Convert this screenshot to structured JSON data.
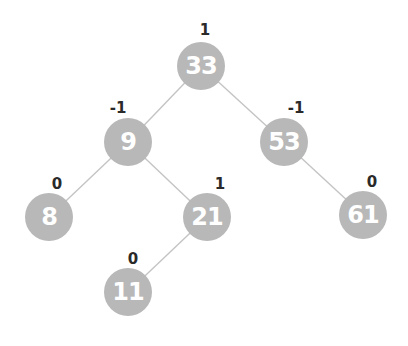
{
  "diagram": {
    "type": "AVL tree with balance factors",
    "nodes": [
      {
        "id": "n33",
        "value": "33",
        "balance": "1",
        "x": 201,
        "y": 66,
        "bx": 205,
        "by": 30
      },
      {
        "id": "n9",
        "value": "9",
        "balance": "-1",
        "x": 128,
        "y": 142,
        "bx": 118,
        "by": 108
      },
      {
        "id": "n53",
        "value": "53",
        "balance": "-1",
        "x": 284,
        "y": 142,
        "bx": 296,
        "by": 108
      },
      {
        "id": "n8",
        "value": "8",
        "balance": "0",
        "x": 49,
        "y": 217,
        "bx": 57,
        "by": 184
      },
      {
        "id": "n21",
        "value": "21",
        "balance": "1",
        "x": 207,
        "y": 217,
        "bx": 220,
        "by": 184
      },
      {
        "id": "n61",
        "value": "61",
        "balance": "0",
        "x": 363,
        "y": 215,
        "bx": 372,
        "by": 182
      },
      {
        "id": "n11",
        "value": "11",
        "balance": "0",
        "x": 128,
        "y": 292,
        "bx": 133,
        "by": 259
      }
    ],
    "edges": [
      [
        "n33",
        "n9"
      ],
      [
        "n33",
        "n53"
      ],
      [
        "n9",
        "n8"
      ],
      [
        "n9",
        "n21"
      ],
      [
        "n53",
        "n61"
      ],
      [
        "n21",
        "n11"
      ]
    ],
    "colors": {
      "node_fill": "#b8b8b8",
      "node_text": "#ffffff",
      "edge": "#c4c4c4",
      "balance_text": "#2a2a2a"
    }
  }
}
